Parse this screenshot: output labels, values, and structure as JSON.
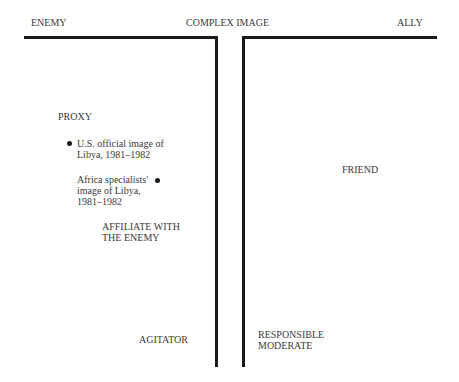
{
  "diagram": {
    "type": "image-spectrum",
    "axis": {
      "left_pole": "ENEMY",
      "center": "COMPLEX IMAGE",
      "right_pole": "ALLY"
    },
    "left_region": {
      "labels": [
        "PROXY",
        "AFFILIATE WITH\nTHE ENEMY",
        "AGITATOR"
      ],
      "points": [
        {
          "label": "U.S. official image of\nLibya, 1981–1982",
          "marker": "bullet-left"
        },
        {
          "label": "Africa specialists'\nimage of Libya,\n1981–1982",
          "marker": "bullet-right"
        }
      ]
    },
    "right_region": {
      "labels": [
        "FRIEND",
        "RESPONSIBLE\nMODERATE"
      ]
    },
    "colors": {
      "lines": "#1a1a1a",
      "text": "#3a3a3a",
      "background": "#ffffff"
    }
  }
}
